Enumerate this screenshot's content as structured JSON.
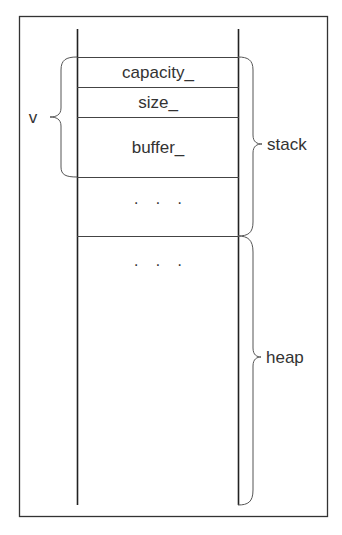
{
  "diagram": {
    "type": "memory-layout",
    "cells": [
      {
        "label": "capacity_"
      },
      {
        "label": "size_"
      },
      {
        "label": "buffer_"
      },
      {
        "label": "· · ·"
      }
    ],
    "heap_cell": {
      "label": "· · ·"
    },
    "braces": {
      "variable": "v",
      "stack": "stack",
      "heap": "heap"
    }
  }
}
